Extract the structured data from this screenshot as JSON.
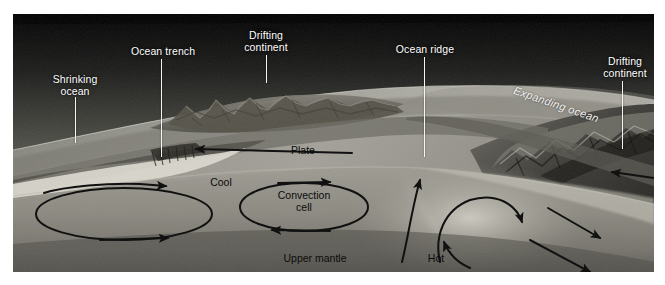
{
  "figure": {
    "frame": {
      "x": 13,
      "y": 14,
      "width": 641,
      "height": 258
    },
    "palette": {
      "sky_top": "#050505",
      "sky_mid": "#4a4a48",
      "sky_low": "#8d8d88",
      "ocean_surface": "#b9b9b2",
      "crust_light": "#d6d4c9",
      "crust_mid": "#9c9a90",
      "mantle": "#8a8880",
      "mantle_deep": "#6f6d66",
      "plate_dark": "#58564f",
      "label_light": "#ffffff",
      "label_dark": "#0c0c0c",
      "arrow": "#111111",
      "leader_line": "#f4f4f4",
      "page_background": "#ffffff"
    },
    "labels": [
      {
        "id": "shrinking-ocean",
        "text": "Shrinking\nocean",
        "style": "light",
        "x": 75,
        "y": 74,
        "leader": {
          "x": 75,
          "y": 97,
          "length": 46
        }
      },
      {
        "id": "ocean-trench",
        "text": "Ocean trench",
        "style": "light",
        "x": 163,
        "y": 46,
        "leader": {
          "x": 161,
          "y": 59,
          "length": 98
        }
      },
      {
        "id": "drifting-continent-left",
        "text": "Drifting\ncontinent",
        "style": "light",
        "x": 266,
        "y": 30,
        "leader": {
          "x": 266,
          "y": 55,
          "length": 28
        }
      },
      {
        "id": "ocean-ridge",
        "text": "Ocean ridge",
        "style": "light",
        "x": 425,
        "y": 44,
        "leader": {
          "x": 424,
          "y": 57,
          "length": 100
        }
      },
      {
        "id": "drifting-continent-right",
        "text": "Drifting\ncontinent",
        "style": "light",
        "x": 625,
        "y": 56,
        "leader": {
          "x": 622,
          "y": 81,
          "length": 68
        }
      },
      {
        "id": "expanding-ocean",
        "text": "Expanding ocean",
        "style": "italic-light",
        "x": 516,
        "y": 84,
        "rotation": 19
      },
      {
        "id": "plate",
        "text": "Plate",
        "style": "dark",
        "x": 303,
        "y": 145
      },
      {
        "id": "cool",
        "text": "Cool",
        "style": "dark",
        "x": 221,
        "y": 177
      },
      {
        "id": "convection-cell",
        "text": "Convection\ncell",
        "style": "dark",
        "x": 304,
        "y": 190
      },
      {
        "id": "upper-mantle",
        "text": "Upper mantle",
        "style": "dark",
        "x": 315,
        "y": 253
      },
      {
        "id": "hot",
        "text": "Hot",
        "style": "dark",
        "x": 436,
        "y": 253
      }
    ]
  }
}
